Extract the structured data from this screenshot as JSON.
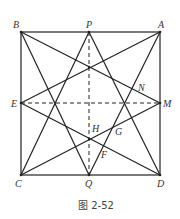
{
  "figure": {
    "caption": "图 2-52",
    "points": {
      "A": {
        "label": "A",
        "x": 160,
        "y": 32
      },
      "B": {
        "label": "B",
        "x": 21,
        "y": 32
      },
      "C": {
        "label": "C",
        "x": 21,
        "y": 175
      },
      "D": {
        "label": "D",
        "x": 160,
        "y": 175
      },
      "P": {
        "label": "P",
        "x": 89,
        "y": 32
      },
      "Q": {
        "label": "Q",
        "x": 89,
        "y": 175
      },
      "E": {
        "label": "E",
        "x": 21,
        "y": 103
      },
      "M": {
        "label": "M",
        "x": 160,
        "y": 103
      },
      "N": {
        "label": "N"
      },
      "H": {
        "label": "H"
      },
      "G": {
        "label": "G"
      },
      "F": {
        "label": "F"
      }
    },
    "solid_segments": [
      "BA",
      "AD",
      "DC",
      "CB",
      "BM",
      "BQ",
      "AE",
      "AQ",
      "PC",
      "PD",
      "ED",
      "MC"
    ],
    "dashed_segments": [
      "PQ",
      "EM"
    ]
  }
}
